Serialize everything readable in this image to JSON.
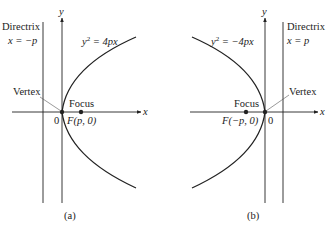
{
  "panels": [
    {
      "id": "a",
      "caption": "(a)",
      "equation_lhs": "y",
      "equation_exp": "2",
      "equation_rhs": " = 4px",
      "directrix_title": "Directrix",
      "directrix_eq": "x = −p",
      "vertex_label": "Vertex",
      "focus_label": "Focus",
      "focus_coord": "F(p, 0)",
      "origin_label": "0",
      "x_axis_label": "x",
      "y_axis_label": "y"
    },
    {
      "id": "b",
      "caption": "(b)",
      "equation_lhs": "y",
      "equation_exp": "2",
      "equation_rhs": " = −4px",
      "directrix_title": "Directrix",
      "directrix_eq": "x = p",
      "vertex_label": "Vertex",
      "focus_label": "Focus",
      "focus_coord": "F(−p, 0)",
      "origin_label": "0",
      "x_axis_label": "x",
      "y_axis_label": "y"
    }
  ],
  "colors": {
    "ink": "#222222",
    "pointer": "#555555"
  }
}
